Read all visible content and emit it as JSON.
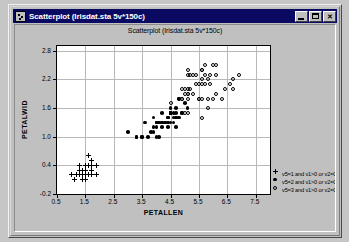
{
  "window": {
    "title": "Scatterplot (Irisdat.sta 5v*150c)",
    "icon": "scatterplot-icon",
    "buttons": {
      "minimize": "minimize-button",
      "maximize": "maximize-button",
      "close_label": "✕"
    }
  },
  "chart_data": {
    "type": "scatter",
    "title": "Scatterplot (Irisdat.sta 5v*150c)",
    "xlabel": "PETALLEN",
    "ylabel": "PETALWID",
    "xlim": [
      0.5,
      8.0
    ],
    "ylim": [
      -0.2,
      2.9
    ],
    "xticks": [
      "0.5",
      "1.5",
      "2.5",
      "3.5",
      "4.5",
      "5.5",
      "6.5",
      "7.5"
    ],
    "xtick_values": [
      0.5,
      1.5,
      2.5,
      3.5,
      4.5,
      5.5,
      6.5,
      7.5
    ],
    "yticks": [
      "2.8",
      "2.2",
      "1.6",
      "1.0",
      "0.4",
      "-0.2"
    ],
    "ytick_values": [
      2.8,
      2.2,
      1.6,
      1.0,
      0.4,
      -0.2
    ],
    "grid": true,
    "legend_position": "bottom-right",
    "legend": [
      {
        "label": "v5=1 and v1>0 or v2=0",
        "marker": "plus",
        "color": "#000000"
      },
      {
        "label": "v5=2 and v1>0 or v2=0",
        "marker": "filled",
        "color": "#000000"
      },
      {
        "label": "v5=3 and v1>0 or v2=0",
        "marker": "open",
        "color": "#000000"
      }
    ],
    "series": [
      {
        "name": "v5=1 and v1>0 or v2=0",
        "marker": "plus",
        "points": [
          [
            1.4,
            0.2
          ],
          [
            1.4,
            0.2
          ],
          [
            1.3,
            0.2
          ],
          [
            1.5,
            0.2
          ],
          [
            1.4,
            0.2
          ],
          [
            1.7,
            0.4
          ],
          [
            1.4,
            0.3
          ],
          [
            1.5,
            0.2
          ],
          [
            1.4,
            0.2
          ],
          [
            1.5,
            0.1
          ],
          [
            1.5,
            0.2
          ],
          [
            1.6,
            0.2
          ],
          [
            1.4,
            0.1
          ],
          [
            1.1,
            0.1
          ],
          [
            1.2,
            0.2
          ],
          [
            1.5,
            0.4
          ],
          [
            1.3,
            0.4
          ],
          [
            1.4,
            0.3
          ],
          [
            1.7,
            0.3
          ],
          [
            1.5,
            0.3
          ],
          [
            1.7,
            0.2
          ],
          [
            1.5,
            0.4
          ],
          [
            1.0,
            0.2
          ],
          [
            1.7,
            0.5
          ],
          [
            1.9,
            0.2
          ],
          [
            1.6,
            0.2
          ],
          [
            1.6,
            0.4
          ],
          [
            1.5,
            0.2
          ],
          [
            1.4,
            0.2
          ],
          [
            1.6,
            0.2
          ],
          [
            1.6,
            0.2
          ],
          [
            1.5,
            0.4
          ],
          [
            1.5,
            0.1
          ],
          [
            1.4,
            0.2
          ],
          [
            1.5,
            0.2
          ],
          [
            1.2,
            0.2
          ],
          [
            1.3,
            0.2
          ],
          [
            1.4,
            0.1
          ],
          [
            1.3,
            0.2
          ],
          [
            1.5,
            0.2
          ],
          [
            1.3,
            0.3
          ],
          [
            1.3,
            0.3
          ],
          [
            1.3,
            0.2
          ],
          [
            1.6,
            0.6
          ],
          [
            1.9,
            0.4
          ],
          [
            1.4,
            0.3
          ],
          [
            1.6,
            0.2
          ],
          [
            1.4,
            0.2
          ],
          [
            1.5,
            0.2
          ],
          [
            1.4,
            0.2
          ]
        ]
      },
      {
        "name": "v5=2 and v1>0 or v2=0",
        "marker": "filled",
        "points": [
          [
            4.7,
            1.4
          ],
          [
            4.5,
            1.5
          ],
          [
            4.9,
            1.5
          ],
          [
            4.0,
            1.3
          ],
          [
            4.6,
            1.5
          ],
          [
            4.5,
            1.3
          ],
          [
            4.7,
            1.6
          ],
          [
            3.3,
            1.0
          ],
          [
            4.6,
            1.3
          ],
          [
            3.9,
            1.4
          ],
          [
            3.5,
            1.0
          ],
          [
            4.2,
            1.5
          ],
          [
            4.0,
            1.0
          ],
          [
            4.7,
            1.4
          ],
          [
            3.6,
            1.3
          ],
          [
            4.4,
            1.4
          ],
          [
            4.5,
            1.5
          ],
          [
            4.1,
            1.0
          ],
          [
            4.5,
            1.5
          ],
          [
            3.9,
            1.1
          ],
          [
            4.8,
            1.8
          ],
          [
            4.0,
            1.3
          ],
          [
            4.9,
            1.5
          ],
          [
            4.7,
            1.2
          ],
          [
            4.3,
            1.3
          ],
          [
            4.4,
            1.4
          ],
          [
            4.8,
            1.4
          ],
          [
            5.0,
            1.7
          ],
          [
            4.5,
            1.5
          ],
          [
            3.5,
            1.0
          ],
          [
            3.8,
            1.1
          ],
          [
            3.7,
            1.0
          ],
          [
            3.9,
            1.2
          ],
          [
            5.1,
            1.6
          ],
          [
            4.5,
            1.5
          ],
          [
            4.5,
            1.6
          ],
          [
            4.7,
            1.5
          ],
          [
            4.4,
            1.3
          ],
          [
            4.1,
            1.3
          ],
          [
            4.0,
            1.3
          ],
          [
            4.4,
            1.2
          ],
          [
            4.6,
            1.4
          ],
          [
            4.0,
            1.2
          ],
          [
            3.3,
            1.0
          ],
          [
            4.2,
            1.3
          ],
          [
            4.2,
            1.2
          ],
          [
            4.2,
            1.3
          ],
          [
            4.3,
            1.3
          ],
          [
            3.0,
            1.1
          ],
          [
            4.1,
            1.3
          ]
        ]
      },
      {
        "name": "v5=3 and v1>0 or v2=0",
        "marker": "open",
        "points": [
          [
            6.0,
            2.5
          ],
          [
            5.1,
            1.9
          ],
          [
            5.9,
            2.1
          ],
          [
            5.6,
            1.8
          ],
          [
            5.8,
            2.2
          ],
          [
            6.6,
            2.1
          ],
          [
            4.5,
            1.7
          ],
          [
            6.3,
            1.8
          ],
          [
            5.8,
            1.8
          ],
          [
            6.1,
            2.5
          ],
          [
            5.1,
            2.0
          ],
          [
            5.3,
            1.9
          ],
          [
            5.5,
            2.1
          ],
          [
            5.0,
            2.0
          ],
          [
            5.1,
            2.4
          ],
          [
            5.3,
            2.3
          ],
          [
            5.5,
            1.8
          ],
          [
            6.7,
            2.2
          ],
          [
            6.9,
            2.3
          ],
          [
            5.0,
            1.5
          ],
          [
            5.7,
            2.3
          ],
          [
            4.9,
            2.0
          ],
          [
            6.7,
            2.0
          ],
          [
            4.9,
            1.8
          ],
          [
            5.7,
            2.1
          ],
          [
            6.0,
            1.8
          ],
          [
            4.8,
            1.8
          ],
          [
            4.9,
            1.8
          ],
          [
            5.6,
            2.1
          ],
          [
            5.8,
            1.6
          ],
          [
            6.1,
            1.9
          ],
          [
            6.4,
            2.0
          ],
          [
            5.6,
            2.2
          ],
          [
            5.1,
            1.5
          ],
          [
            5.6,
            1.4
          ],
          [
            6.1,
            2.3
          ],
          [
            5.6,
            2.4
          ],
          [
            5.5,
            1.8
          ],
          [
            4.8,
            1.8
          ],
          [
            5.4,
            2.1
          ],
          [
            5.6,
            2.4
          ],
          [
            5.1,
            2.3
          ],
          [
            5.1,
            1.9
          ],
          [
            5.9,
            2.3
          ],
          [
            5.7,
            2.5
          ],
          [
            5.2,
            2.3
          ],
          [
            5.0,
            1.9
          ],
          [
            5.2,
            2.0
          ],
          [
            5.4,
            2.3
          ],
          [
            5.1,
            1.8
          ]
        ]
      }
    ]
  }
}
